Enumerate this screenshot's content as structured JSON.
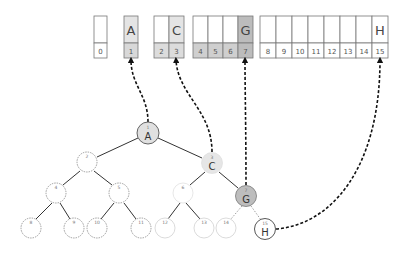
{
  "diagram": {
    "arrays": [
      {
        "name": "level-0",
        "cells": [
          {
            "index": "0",
            "value": "",
            "shade": "none"
          }
        ]
      },
      {
        "name": "level-1",
        "cells": [
          {
            "index": "1",
            "value": "A",
            "shade": "light"
          }
        ]
      },
      {
        "name": "level-2",
        "cells": [
          {
            "index": "2",
            "value": "",
            "shade": "none"
          },
          {
            "index": "3",
            "value": "C",
            "shade": "light"
          }
        ]
      },
      {
        "name": "level-3",
        "cells": [
          {
            "index": "4",
            "value": "",
            "shade": "mid"
          },
          {
            "index": "5",
            "value": "",
            "shade": "mid"
          },
          {
            "index": "6",
            "value": "",
            "shade": "mid"
          },
          {
            "index": "7",
            "value": "G",
            "shade": "dark"
          }
        ]
      },
      {
        "name": "level-4",
        "cells": [
          {
            "index": "8",
            "value": ""
          },
          {
            "index": "9",
            "value": ""
          },
          {
            "index": "10",
            "value": ""
          },
          {
            "index": "11",
            "value": ""
          },
          {
            "index": "12",
            "value": ""
          },
          {
            "index": "13",
            "value": ""
          },
          {
            "index": "14",
            "value": ""
          },
          {
            "index": "15",
            "value": "H"
          }
        ]
      }
    ],
    "nodes": [
      {
        "index": "1",
        "label": "A"
      },
      {
        "index": "2",
        "label": ""
      },
      {
        "index": "3",
        "label": "C"
      },
      {
        "index": "4",
        "label": ""
      },
      {
        "index": "5",
        "label": ""
      },
      {
        "index": "6",
        "label": ""
      },
      {
        "index": "7",
        "label": "G"
      },
      {
        "index": "8",
        "label": ""
      },
      {
        "index": "9",
        "label": ""
      },
      {
        "index": "10",
        "label": ""
      },
      {
        "index": "11",
        "label": ""
      },
      {
        "index": "12",
        "label": ""
      },
      {
        "index": "13",
        "label": ""
      },
      {
        "index": "14",
        "label": ""
      },
      {
        "index": "15",
        "label": "H"
      }
    ],
    "path_nodes": [
      "A",
      "C",
      "G",
      "H"
    ],
    "colors": {
      "light": "#e4e4e4",
      "mid": "#cfcfcf",
      "dark": "#b8b8b8",
      "node_dark": "#bdbdbd",
      "stroke": "#555555"
    }
  }
}
